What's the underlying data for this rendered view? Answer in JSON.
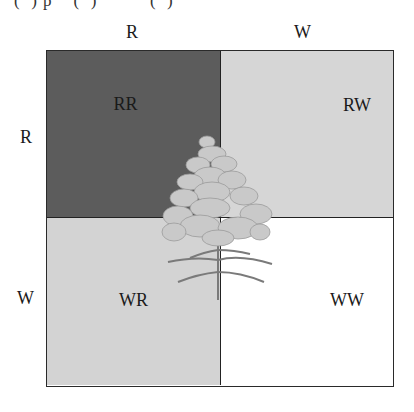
{
  "caption_fragment": "(  ) p    (  )          (  )",
  "punnett_square": {
    "column_alleles": [
      "R",
      "W"
    ],
    "row_alleles": [
      "R",
      "W"
    ],
    "cells": [
      {
        "genotype": "RR",
        "color": "#5c5c5c"
      },
      {
        "genotype": "RW",
        "color": "#d6d6d6"
      },
      {
        "genotype": "WR",
        "color": "#d3d3d3"
      },
      {
        "genotype": "WW",
        "color": "#ffffff"
      }
    ]
  },
  "illustration": {
    "name": "snapdragon-flower",
    "flower_color": "#c8c8c8",
    "stem_color": "#8a8a8a"
  }
}
